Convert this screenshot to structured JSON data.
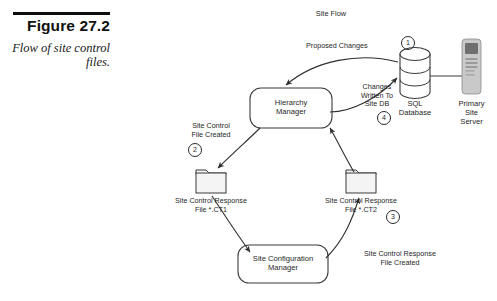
{
  "figure": {
    "number": "Figure 27.2",
    "caption": "Flow of site\ncontrol files."
  },
  "diagram": {
    "title": "Site Flow",
    "nodes": {
      "hierarchy_manager": "Hierarchy\nManager",
      "site_configuration_manager": "Site Configuration\nManager",
      "sql_database": "SQL\nDatabase",
      "primary_site_server": "Primary\nSite\nServer",
      "folder_ct1": "Site Control Response\nFile  *.CT1",
      "folder_ct2": "Site Control Response\nFile  *.CT2"
    },
    "edge_labels": {
      "proposed_changes": "Proposed Changes",
      "changes_written_to_site_db": "Changes\nWritten To\nSite DB",
      "site_control_file_created": "Site Control\nFile Created",
      "site_control_response_file_created": "Site Control Response\nFile  Created"
    },
    "step_markers": {
      "one": "1",
      "two": "2",
      "three": "3",
      "four": "4"
    },
    "colors": {
      "line": "#3a3a3a",
      "text": "#1f1f1f",
      "server_body": "#c9c9c9",
      "server_bezel": "#6f6f6f",
      "folder_fill": "#f4f4f4",
      "rule": "#0d0d0d"
    }
  }
}
